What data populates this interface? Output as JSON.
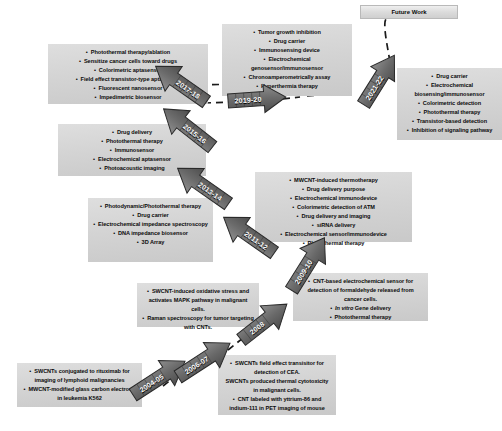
{
  "diagram": {
    "type": "zigzag-timeline",
    "colors": {
      "box_fill": "#d6d6d6",
      "arrow_fill": "#6e6e6e",
      "arrow_text": "#ffffff",
      "text": "#0b0b0b",
      "future_fill": "#e2e2e2",
      "background": "#ffffff"
    }
  },
  "future_work": {
    "label": "Future Work"
  },
  "milestones": [
    {
      "id": "m2004",
      "year": "2004-05",
      "items": [
        {
          "text": "SWCNTs conjugated to rituximab for imaging of lymphoid malignancies",
          "bullet": true
        },
        {
          "text": "MWCNT-modified glass carbon electrode in leukemia K562",
          "bullet": true
        }
      ]
    },
    {
      "id": "m2006",
      "year": "2006-07",
      "items": [
        {
          "text": "SWCNTs field effect transisitor for detection of CEA.",
          "bullet": true
        },
        {
          "text": "SWCNTs produced thermal cytotoxicity in malignant cells.",
          "bullet": false
        },
        {
          "text": "CNT labeled with yttrium-86 and indium-111 in PET imaging of mouse",
          "bullet": true
        }
      ]
    },
    {
      "id": "m2008",
      "year": "2008",
      "items": [
        {
          "text": "SWCNT-induced oxidative stress and activates MAPK pathway in malignant cells.",
          "bullet": true
        },
        {
          "text": "Raman spectroscopy for tumor targeting with CNTs.",
          "bullet": true
        }
      ]
    },
    {
      "id": "m2009",
      "year": "2009-10",
      "items": [
        {
          "text": "CNT-based electrochemical sensor for detection of formaldehyde released from cancer cells.",
          "bullet": true
        },
        {
          "text": "In vitro Gene delivery",
          "bullet": true,
          "italic_prefix": "In vitro"
        },
        {
          "text": "Photothermal therapy",
          "bullet": true
        }
      ]
    },
    {
      "id": "m2011",
      "year": "2011-12",
      "items": [
        {
          "text": "MWCNT-induced thermotherapy",
          "bullet": true
        },
        {
          "text": "Drug delivery purpose",
          "bullet": true
        },
        {
          "text": "Electrochemical immunodevice",
          "bullet": true
        },
        {
          "text": "Colorimetric detection of ATM",
          "bullet": true
        },
        {
          "text": "Drug delivery and imaging",
          "bullet": true
        },
        {
          "text": "siRNA delivery",
          "bullet": true
        },
        {
          "text": "Electrochemical sensor/immunodevice",
          "bullet": true
        },
        {
          "text": "Photothermal therapy",
          "bullet": true
        }
      ]
    },
    {
      "id": "m2013",
      "year": "2013-14",
      "items": [
        {
          "text": "Photodynamic/Photothermal therapy",
          "bullet": true
        },
        {
          "text": "Drug carrier",
          "bullet": true
        },
        {
          "text": "Electrochemical impedance spectroscopy",
          "bullet": true
        },
        {
          "text": "DNA impedance biosensor",
          "bullet": true
        },
        {
          "text": "3D Array",
          "bullet": true
        }
      ]
    },
    {
      "id": "m2015",
      "year": "2015-16",
      "items": [
        {
          "text": "Drug delivery",
          "bullet": true
        },
        {
          "text": "Photothermal therapy",
          "bullet": true
        },
        {
          "text": "Immunosensor",
          "bullet": true
        },
        {
          "text": "Electrochemical aptasensor",
          "bullet": true
        },
        {
          "text": "Photoacoustic imaging",
          "bullet": true
        }
      ]
    },
    {
      "id": "m2017",
      "year": "2017-18",
      "items": [
        {
          "text": "Photothermal therapy/ablation",
          "bullet": true
        },
        {
          "text": "Sensitize cancer cells toward drugs",
          "bullet": true
        },
        {
          "text": "Colorimetric aptasensor",
          "bullet": true
        },
        {
          "text": "Field effect transistor-type aptasensor",
          "bullet": true
        },
        {
          "text": "Fluorescent nanosensor",
          "bullet": true
        },
        {
          "text": "Impedimetric biosensor",
          "bullet": true
        }
      ]
    },
    {
      "id": "m2019",
      "year": "2019-20",
      "items": [
        {
          "text": "Tumor growth inhibition",
          "bullet": true
        },
        {
          "text": "Drug carrier",
          "bullet": true
        },
        {
          "text": "Immunosensing device",
          "bullet": true
        },
        {
          "text": "Electrochemical genosensor/immunosensor",
          "bullet": true
        },
        {
          "text": "Chronoamperometrically assay",
          "bullet": true
        },
        {
          "text": "Hyperthermia therapy",
          "bullet": true
        }
      ]
    },
    {
      "id": "m2021",
      "year": "2021-22",
      "items": [
        {
          "text": "Drug carrier",
          "bullet": true
        },
        {
          "text": "Electrochemical biosensing/immunosensor",
          "bullet": true
        },
        {
          "text": "Colorimetric detection",
          "bullet": true
        },
        {
          "text": "Photothermal therapy",
          "bullet": true
        },
        {
          "text": "Transistor-based detection",
          "bullet": true
        },
        {
          "text": "Inhibition of signaling pathway",
          "bullet": true
        }
      ]
    }
  ]
}
